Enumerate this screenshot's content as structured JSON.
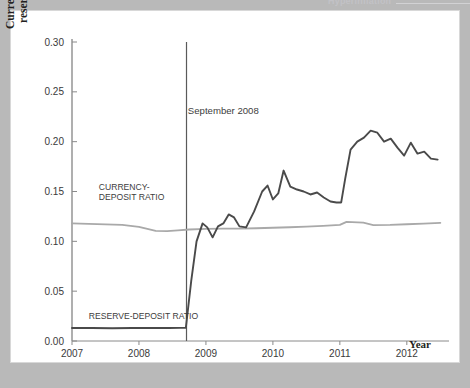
{
  "page": {
    "ghost_header": "Hyperinflation",
    "background_color": "#b9b9b9",
    "figure_background": "#ffffff"
  },
  "chart_data": {
    "type": "line",
    "title": "",
    "xlabel": "Year",
    "ylabel": "Currency-deposit ratio and reserve-deposit ratio",
    "xlim": [
      2007.0,
      2012.6
    ],
    "ylim": [
      0.0,
      0.3
    ],
    "grid": false,
    "legend_position": "inline-annotations",
    "y_ticks": [
      "0.00",
      "0.05",
      "0.10",
      "0.15",
      "0.20",
      "0.25",
      "0.30"
    ],
    "y_tick_values": [
      0.0,
      0.05,
      0.1,
      0.15,
      0.2,
      0.25,
      0.3
    ],
    "x_ticks": [
      "2007",
      "2008",
      "2009",
      "2010",
      "2011",
      "2012"
    ],
    "x_tick_values": [
      2007,
      2008,
      2009,
      2010,
      2011,
      2012
    ],
    "annotations": [
      {
        "text": "September 2008",
        "x": 2008.73,
        "y": 0.228,
        "kind": "event-label"
      },
      {
        "text": "CURRENCY-",
        "x": 2007.4,
        "y": 0.152,
        "kind": "series-label"
      },
      {
        "text": "DEPOSIT RATIO",
        "x": 2007.4,
        "y": 0.141,
        "kind": "series-label"
      },
      {
        "text": "RESERVE-DEPOSIT RATIO",
        "x": 2007.25,
        "y": 0.022,
        "kind": "series-label"
      }
    ],
    "event_line": {
      "label": "September 2008",
      "x": 2008.71,
      "y_top": 0.3,
      "y_bottom": 0.0,
      "color": "#5a5a5a"
    },
    "series": [
      {
        "name": "CURRENCY-DEPOSIT RATIO",
        "color": "#a9a9a9",
        "x": [
          2007.0,
          2007.25,
          2007.5,
          2007.75,
          2008.0,
          2008.25,
          2008.42,
          2008.58,
          2008.75,
          2009.0,
          2009.25,
          2009.5,
          2009.75,
          2010.0,
          2010.25,
          2010.5,
          2010.75,
          2011.0,
          2011.1,
          2011.35,
          2011.5,
          2011.75,
          2012.0,
          2012.25,
          2012.5
        ],
        "values": [
          0.118,
          0.1175,
          0.117,
          0.1165,
          0.1145,
          0.1105,
          0.1102,
          0.111,
          0.1118,
          0.1125,
          0.1128,
          0.1128,
          0.1132,
          0.1136,
          0.1142,
          0.1148,
          0.1155,
          0.1165,
          0.1195,
          0.1188,
          0.1163,
          0.1165,
          0.1172,
          0.1178,
          0.1185
        ]
      },
      {
        "name": "RESERVE-DEPOSIT RATIO",
        "color": "#4a4a4a",
        "x": [
          2007.0,
          2007.3,
          2007.6,
          2007.9,
          2008.2,
          2008.45,
          2008.62,
          2008.7,
          2008.78,
          2008.86,
          2008.95,
          2009.02,
          2009.1,
          2009.18,
          2009.26,
          2009.34,
          2009.42,
          2009.5,
          2009.6,
          2009.72,
          2009.84,
          2009.92,
          2010.0,
          2010.08,
          2010.16,
          2010.26,
          2010.36,
          2010.46,
          2010.56,
          2010.66,
          2010.76,
          2010.86,
          2010.95,
          2011.02,
          2011.08,
          2011.16,
          2011.26,
          2011.36,
          2011.46,
          2011.56,
          2011.66,
          2011.76,
          2011.86,
          2011.96,
          2012.06,
          2012.16,
          2012.26,
          2012.36,
          2012.46
        ],
        "values": [
          0.013,
          0.013,
          0.0128,
          0.013,
          0.0131,
          0.0131,
          0.0132,
          0.0132,
          0.06,
          0.1,
          0.118,
          0.114,
          0.104,
          0.115,
          0.118,
          0.127,
          0.124,
          0.115,
          0.114,
          0.13,
          0.15,
          0.156,
          0.142,
          0.148,
          0.171,
          0.155,
          0.152,
          0.15,
          0.147,
          0.149,
          0.144,
          0.14,
          0.139,
          0.139,
          0.163,
          0.192,
          0.2,
          0.204,
          0.211,
          0.209,
          0.2,
          0.203,
          0.194,
          0.186,
          0.199,
          0.188,
          0.19,
          0.183,
          0.182
        ]
      }
    ]
  },
  "axes": {
    "y_axis_color": "#6d6d6d",
    "x_axis_color": "#8a8a8a",
    "tick_color": "#8a8a8a"
  }
}
